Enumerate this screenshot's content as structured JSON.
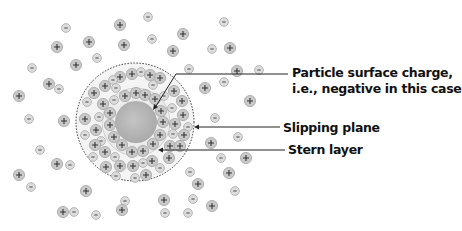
{
  "diagram": {
    "labels": {
      "particle_line1": "Particle surface charge,",
      "particle_line2": "i.e., negative in this case",
      "slipping_plane": "Slipping plane",
      "stern_layer": "Stern layer"
    },
    "ion_symbols": {
      "positive": "+",
      "negative": "-"
    },
    "colors": {
      "ion_fill": "#c9c9c9",
      "ion_ring": "#9a9a9a",
      "particle": "#b5b5b5",
      "line": "#222222",
      "text": "#111111"
    },
    "geometry": {
      "center": [
        135,
        122
      ],
      "particle_radius": 21,
      "stern_radius": 34,
      "slipping_plane_radius": 59
    }
  }
}
